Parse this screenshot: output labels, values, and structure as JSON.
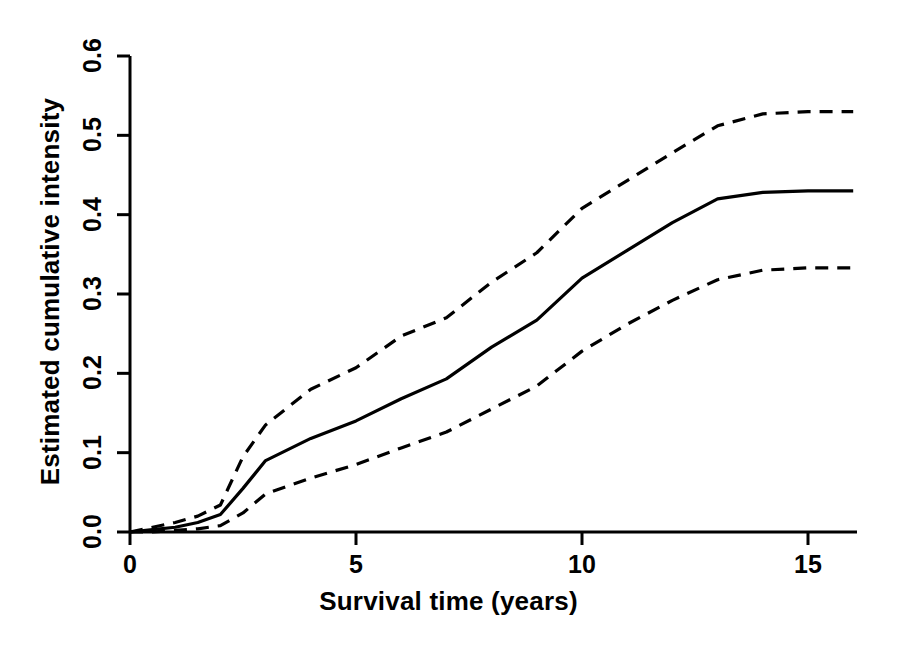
{
  "chart_data": {
    "type": "line",
    "title": "",
    "subtitle": "",
    "xlabel": "Survival time (years)",
    "ylabel": "Estimated cumulative intensity",
    "xlim": [
      0,
      16
    ],
    "ylim": [
      0.0,
      0.6
    ],
    "xticks": [
      0,
      5,
      10,
      15
    ],
    "xtick_labels": [
      "0",
      "5",
      "10",
      "15"
    ],
    "yticks": [
      0.0,
      0.1,
      0.2,
      0.3,
      0.4,
      0.5,
      0.6
    ],
    "ytick_labels": [
      "0.0",
      "0.1",
      "0.2",
      "0.3",
      "0.4",
      "0.5",
      "0.6"
    ],
    "grid": false,
    "legend": null,
    "annotations": [],
    "x": [
      0,
      0.5,
      1,
      1.5,
      2,
      2.5,
      3,
      4,
      5,
      6,
      7,
      8,
      9,
      10,
      11,
      12,
      13,
      14,
      15,
      16
    ],
    "series": [
      {
        "name": "Estimated cumulative intensity",
        "style": "solid",
        "color": "#000000",
        "values": [
          0.0,
          0.003,
          0.006,
          0.012,
          0.022,
          0.055,
          0.09,
          0.118,
          0.14,
          0.168,
          0.193,
          0.233,
          0.267,
          0.32,
          0.355,
          0.39,
          0.42,
          0.428,
          0.43,
          0.43
        ]
      },
      {
        "name": "Upper confidence limit",
        "style": "dashed",
        "color": "#000000",
        "values": [
          0.0,
          0.006,
          0.012,
          0.02,
          0.034,
          0.095,
          0.135,
          0.18,
          0.207,
          0.247,
          0.27,
          0.315,
          0.352,
          0.408,
          0.443,
          0.478,
          0.512,
          0.527,
          0.53,
          0.53
        ]
      },
      {
        "name": "Lower confidence limit",
        "style": "dashed",
        "color": "#000000",
        "values": [
          0.0,
          0.0,
          0.002,
          0.004,
          0.008,
          0.024,
          0.048,
          0.068,
          0.085,
          0.106,
          0.126,
          0.155,
          0.184,
          0.228,
          0.262,
          0.292,
          0.318,
          0.33,
          0.333,
          0.333
        ]
      }
    ]
  },
  "axes": {
    "x_axis_name": "survival-time-axis",
    "y_axis_name": "cumulative-intensity-axis"
  }
}
